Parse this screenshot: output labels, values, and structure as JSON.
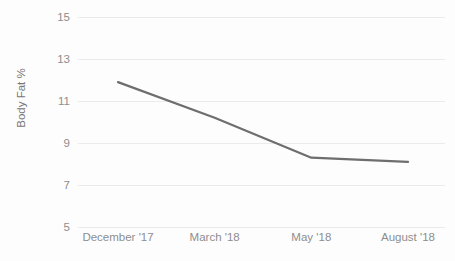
{
  "chart_data": {
    "type": "line",
    "title": "",
    "xlabel": "",
    "ylabel": "Body Fat %",
    "categories": [
      "December '17",
      "March '18",
      "May '18",
      "August '18"
    ],
    "series": [
      {
        "name": "Body Fat %",
        "color": "#6e6e6e",
        "values": [
          11.9,
          10.2,
          8.3,
          8.1
        ]
      }
    ],
    "x": [
      0,
      1,
      2,
      3
    ],
    "ylim": [
      5,
      15
    ],
    "yticks": [
      5,
      7,
      9,
      11,
      13,
      15
    ],
    "ytick_labels": [
      "5",
      "7",
      "9",
      "11",
      "13",
      "15"
    ],
    "xtick_labels": [
      "December '17",
      "March '18",
      "May '18",
      "August '18"
    ],
    "grid": "horizontal",
    "legend": "none",
    "gridline_color": "#ebebeb",
    "tick_label_color": "#8d8d8d",
    "axis_title_color": "#767676",
    "background_color": "#fdfdfd",
    "annotations": []
  },
  "axes": {
    "y_title": "Body Fat %",
    "y_ticks": [
      {
        "label": "15",
        "value": 15
      },
      {
        "label": "13",
        "value": 13
      },
      {
        "label": "11",
        "value": 11
      },
      {
        "label": "9",
        "value": 9
      },
      {
        "label": "7",
        "value": 7
      },
      {
        "label": "5",
        "value": 5
      }
    ],
    "x_ticks": [
      {
        "label": "December '17"
      },
      {
        "label": "March '18"
      },
      {
        "label": "May '18"
      },
      {
        "label": "August '18"
      }
    ]
  },
  "clipped_title": "",
  "colors": {
    "line": "#6e6e6e",
    "grid": "#ebebeb",
    "text": "#8d8d8d",
    "background": "#fdfdfd"
  }
}
